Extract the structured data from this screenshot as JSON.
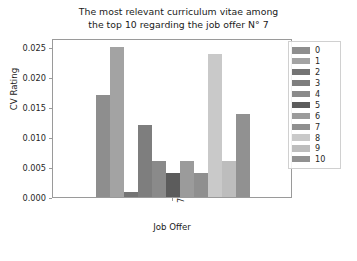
{
  "chart_data": {
    "type": "bar",
    "title": "The most relevant curriculum vitae among the top 10 regarding the job offer N° 7",
    "title_lines": [
      "The most relevant curriculum vitae among",
      "the top 10 regarding the job offer N° 7"
    ],
    "xlabel": "Job Offer",
    "ylabel": "CV Rating",
    "categories": [
      "7"
    ],
    "x_tick_labels": [
      "7"
    ],
    "x_tick_rotation": 90,
    "ylim": [
      0.0,
      0.0265
    ],
    "y_ticks": [
      0.0,
      0.005,
      0.01,
      0.015,
      0.02,
      0.025
    ],
    "y_tick_labels": [
      "0.000",
      "0.005",
      "0.010",
      "0.015",
      "0.020",
      "0.025"
    ],
    "grid": false,
    "legend_position": "right-outside",
    "legend_title": "",
    "series": [
      {
        "name": "0",
        "values": [
          0.017
        ],
        "color": "#8e8e8e"
      },
      {
        "name": "1",
        "values": [
          0.025
        ],
        "color": "#a3a3a3"
      },
      {
        "name": "2",
        "values": [
          0.0009
        ],
        "color": "#747474"
      },
      {
        "name": "3",
        "values": [
          0.012
        ],
        "color": "#7e7e7e"
      },
      {
        "name": "4",
        "values": [
          0.006
        ],
        "color": "#8a8a8a"
      },
      {
        "name": "5",
        "values": [
          0.004
        ],
        "color": "#5c5c5c"
      },
      {
        "name": "6",
        "values": [
          0.006
        ],
        "color": "#9b9b9b"
      },
      {
        "name": "7",
        "values": [
          0.004
        ],
        "color": "#8f8f8f"
      },
      {
        "name": "8",
        "values": [
          0.0238
        ],
        "color": "#c9c9c9"
      },
      {
        "name": "9",
        "values": [
          0.006
        ],
        "color": "#bdbdbd"
      },
      {
        "name": "10",
        "values": [
          0.0139
        ],
        "color": "#919191"
      }
    ]
  },
  "axes": {
    "frame_color": "#9a9a9a",
    "background": "#ffffff",
    "text_color": "#1a1a1a"
  },
  "figure": {
    "background": "#ffffff"
  }
}
